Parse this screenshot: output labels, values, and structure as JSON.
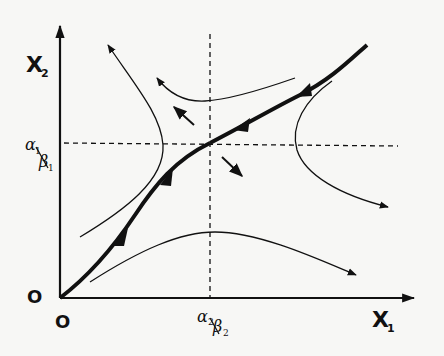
{
  "diagram": {
    "type": "phase-plane",
    "axes": {
      "x_label": "X",
      "x_subscript": "1",
      "y_label": "X",
      "y_subscript": "2",
      "origin_x_label": "O",
      "origin_y_label": "O"
    },
    "equilibrium": {
      "x_label_num": "α",
      "x_label_num_sub": "2",
      "x_label_den": "β",
      "x_label_den_sub": "2",
      "y_label_num": "α",
      "y_label_num_sub": "1",
      "y_label_den": "β",
      "y_label_den_sub": "1",
      "kind": "saddle point"
    },
    "colors": {
      "ink": "#111111",
      "background": "#f7f7f5"
    }
  }
}
